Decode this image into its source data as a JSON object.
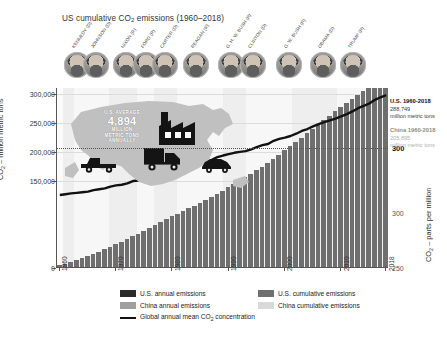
{
  "title_main": "US cumulative CO",
  "title_sub": "2",
  "title_tail": " emissions (1960–2018)",
  "axes": {
    "y_left_label_main": "CO",
    "y_left_label_sub": "2",
    "y_left_label_tail": " – million metric tons",
    "y_left_ticks": [
      "300,000",
      "250,000",
      "200,000",
      "150,000",
      "0"
    ],
    "y_left_values": [
      300000,
      250000,
      200000,
      150000,
      0
    ],
    "y_left_max": 310000,
    "x_ticks": [
      "1960",
      "1970",
      "1980",
      "1990",
      "2000",
      "2010",
      "2018"
    ],
    "x_tick_years": [
      1960,
      1970,
      1980,
      1990,
      2000,
      2010,
      2018
    ],
    "y_right_label_main": "CO",
    "y_right_label_sub": "2",
    "y_right_label_tail": " – parts per million",
    "y_right_ticks": [
      "300",
      "300",
      "250"
    ],
    "y_right_strong_index": 0
  },
  "annotations": {
    "us": {
      "header": "U.S. 1960-2018",
      "value": "288,749",
      "unit": "million metric tons"
    },
    "china": {
      "header": "China 1960-2018",
      "value": "205,895",
      "unit": "million metric tons"
    }
  },
  "infographic": {
    "line1": "U.S. AVERAGE",
    "line2": "4,894",
    "line3": "MILLION",
    "line4": "METRIC TONS",
    "line5": "ANNUALLY",
    "icons": [
      "us-map-icon",
      "factory-icon",
      "truck-icon",
      "pickup-truck-icon",
      "car-icon"
    ]
  },
  "presidents": [
    {
      "label": "KENNEDY (D)",
      "party": "D",
      "x": 8,
      "start": 1961,
      "end": 1963
    },
    {
      "label": "JOHNSON (D)",
      "party": "D",
      "x": 27,
      "start": 1963,
      "end": 1969
    },
    {
      "label": "NIXON (R)",
      "party": "R",
      "x": 57,
      "start": 1969,
      "end": 1974
    },
    {
      "label": "FORD (R)",
      "party": "R",
      "x": 77,
      "start": 1974,
      "end": 1977
    },
    {
      "label": "CARTER (D)",
      "party": "D",
      "x": 96,
      "start": 1977,
      "end": 1981
    },
    {
      "label": "REAGAN (R)",
      "party": "R",
      "x": 127,
      "start": 1981,
      "end": 1989
    },
    {
      "label": "G. H. W. BUSH (R)",
      "party": "R",
      "x": 162,
      "start": 1989,
      "end": 1993
    },
    {
      "label": "CLINTON (D)",
      "party": "D",
      "x": 184,
      "start": 1993,
      "end": 2001
    },
    {
      "label": "G. W. BUSH (R)",
      "party": "R",
      "x": 220,
      "start": 2001,
      "end": 2009
    },
    {
      "label": "OBAMA (D)",
      "party": "D",
      "x": 254,
      "start": 2009,
      "end": 2017
    },
    {
      "label": "TRUMP (R)",
      "party": "R",
      "x": 284,
      "start": 2017,
      "end": 2018
    }
  ],
  "legend": {
    "items": [
      {
        "name": "us-annual",
        "label": "U.S. annual emissions",
        "color": "#2b2b2b"
      },
      {
        "name": "us-cumulative",
        "label": "U.S. cumulative emissions",
        "color": "#6f6f6f"
      },
      {
        "name": "cn-annual",
        "label": "China annual emissions",
        "color": "#9f9f9f"
      },
      {
        "name": "cn-cumulative",
        "label": "China cumulative emissions",
        "color": "#d9d9d9"
      }
    ],
    "line_item_main": "Global annual mean CO",
    "line_item_sub": "2",
    "line_item_tail": " concentration",
    "line_color": "#111111"
  },
  "colors": {
    "us_cumulative": "#6f6f6f",
    "china_cumulative": "#d3d3d3",
    "us_annual": "#2b2b2b",
    "china_annual": "#9f9f9f",
    "co2_line": "#111111",
    "band": "#eeeeee",
    "plot_bg": "#fbfbfb"
  },
  "chart_data": {
    "type": "bar",
    "title": "US cumulative CO2 emissions (1960–2018)",
    "xlabel": "",
    "ylabel": "CO2 – million metric tons",
    "ylabel_right": "CO2 – parts per million",
    "xlim": [
      1960,
      2018
    ],
    "ylim": [
      0,
      310000
    ],
    "ylim_right": [
      250,
      415
    ],
    "grid": true,
    "legend_position": "bottom",
    "x": [
      1960,
      1961,
      1962,
      1963,
      1964,
      1965,
      1966,
      1967,
      1968,
      1969,
      1970,
      1971,
      1972,
      1973,
      1974,
      1975,
      1976,
      1977,
      1978,
      1979,
      1980,
      1981,
      1982,
      1983,
      1984,
      1985,
      1986,
      1987,
      1988,
      1989,
      1990,
      1991,
      1992,
      1993,
      1994,
      1995,
      1996,
      1997,
      1998,
      1999,
      2000,
      2001,
      2002,
      2003,
      2004,
      2005,
      2006,
      2007,
      2008,
      2009,
      2010,
      2011,
      2012,
      2013,
      2014,
      2015,
      2016,
      2017,
      2018
    ],
    "series": [
      {
        "name": "U.S. cumulative emissions",
        "type": "bar",
        "color": "#6f6f6f",
        "values": [
          2880,
          5840,
          8900,
          12070,
          15410,
          18870,
          22510,
          26280,
          30280,
          34510,
          38830,
          43240,
          47900,
          52800,
          57570,
          62190,
          67120,
          72160,
          77280,
          82440,
          87390,
          92100,
          96610,
          101050,
          105700,
          110410,
          115210,
          120290,
          125800,
          131470,
          137060,
          142590,
          148300,
          154180,
          160270,
          166510,
          173100,
          179850,
          186620,
          193560,
          200770,
          207890,
          215130,
          222560,
          230220,
          237950,
          245580,
          253350,
          260860,
          267970,
          275240,
          282360,
          289170,
          296310,
          303570,
          310500,
          317250,
          323940,
          330650
        ]
      },
      {
        "name": "China cumulative emissions",
        "type": "bar",
        "color": "#d3d3d3",
        "values": [
          780,
          1290,
          1720,
          2180,
          2730,
          3350,
          4070,
          4720,
          5510,
          6470,
          7670,
          8980,
          10350,
          11810,
          13250,
          15060,
          16890,
          18840,
          21200,
          23600,
          25970,
          28340,
          30830,
          33430,
          36340,
          39430,
          42700,
          46210,
          50070,
          54060,
          58140,
          62460,
          67060,
          71960,
          77150,
          82830,
          88740,
          94840,
          100890,
          106960,
          113190,
          119620,
          126580,
          134720,
          144290,
          155030,
          166810,
          179310,
          192020,
          205000,
          218990,
          234370,
          249810,
          265850,
          282040,
          298230,
          314270,
          330610,
          347580
        ]
      }
    ],
    "co2_concentration_line": {
      "name": "Global annual mean CO2 concentration",
      "type": "line",
      "color": "#111111",
      "unit": "parts per million",
      "values": [
        316.9,
        317.6,
        318.4,
        318.9,
        319.4,
        320.0,
        321.4,
        322.2,
        323.0,
        324.6,
        325.7,
        326.3,
        327.5,
        329.7,
        330.2,
        331.1,
        332.0,
        333.8,
        335.4,
        336.8,
        338.7,
        340.1,
        341.4,
        343.0,
        344.6,
        346.0,
        347.4,
        349.2,
        351.6,
        353.1,
        354.4,
        355.6,
        356.4,
        357.1,
        358.8,
        360.8,
        362.6,
        363.7,
        366.6,
        368.3,
        369.5,
        371.0,
        373.1,
        375.6,
        377.4,
        379.8,
        381.9,
        383.8,
        385.4,
        386.9,
        389.0,
        391.0,
        393.5,
        396.5,
        398.6,
        400.8,
        404.2,
        406.5,
        408.5
      ]
    }
  }
}
